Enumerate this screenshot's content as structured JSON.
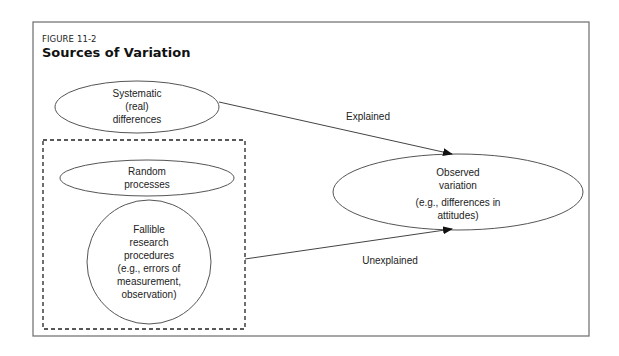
{
  "figure": {
    "label": "FIGURE 11-2",
    "title": "Sources of Variation"
  },
  "nodes": {
    "systematic": {
      "lines": [
        "Systematic",
        "(real)",
        "differences"
      ]
    },
    "random": {
      "lines": [
        "Random",
        "processes"
      ]
    },
    "fallible": {
      "lines": [
        "Fallible",
        "research",
        "procedures",
        "(e.g., errors of",
        "measurement,",
        "observation)"
      ]
    },
    "observed": {
      "lines": [
        "Observed",
        "variation",
        "(e.g., differences in",
        "attitudes)"
      ]
    }
  },
  "edges": {
    "explained": {
      "label": "Explained",
      "from": "systematic",
      "to": "observed"
    },
    "unexplained": {
      "label": "Unexplained",
      "from": "error-group",
      "to": "observed"
    }
  },
  "colors": {
    "stroke": "#444444",
    "frame": "#777777",
    "text": "#222222"
  }
}
